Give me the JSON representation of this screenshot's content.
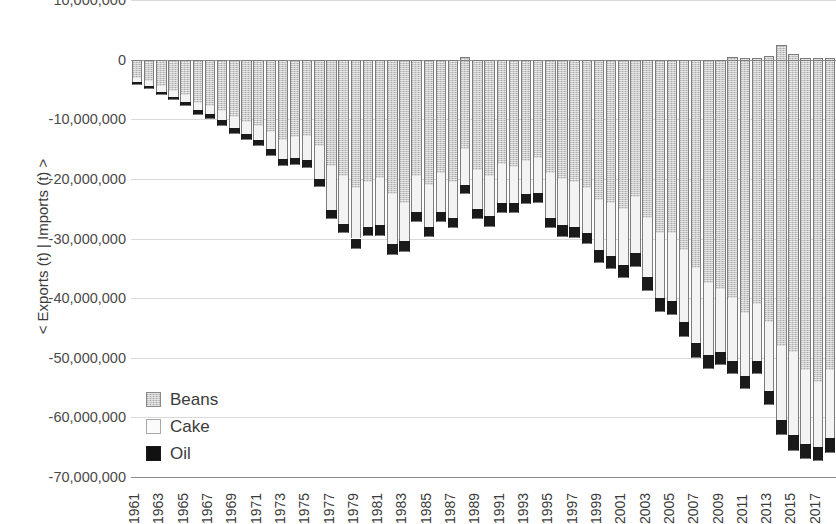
{
  "chart_data": {
    "type": "bar",
    "stacked": true,
    "orientation": "vertical",
    "title": "",
    "xlabel": "",
    "ylabel": "< Exports (t) | Imports (t) >",
    "ylim": [
      -70000000,
      10000000
    ],
    "ytick_labels": [
      "10,000,000",
      "0",
      "-10,000,000",
      "-20,000,000",
      "-30,000,000",
      "-40,000,000",
      "-50,000,000",
      "-60,000,000",
      "-70,000,000"
    ],
    "ytick_values": [
      10000000,
      0,
      -10000000,
      -20000000,
      -30000000,
      -40000000,
      -50000000,
      -60000000,
      -70000000
    ],
    "grid": true,
    "legend_position": "inside-lower-left",
    "legend": [
      "Beans",
      "Cake",
      "Oil"
    ],
    "colors": {
      "Beans": "#c9c9c9",
      "Cake": "#f3f3f3",
      "Oil": "#1a1a1a"
    },
    "categories": [
      1961,
      1962,
      1963,
      1964,
      1965,
      1966,
      1967,
      1968,
      1969,
      1970,
      1971,
      1972,
      1973,
      1974,
      1975,
      1976,
      1977,
      1978,
      1979,
      1980,
      1981,
      1982,
      1983,
      1984,
      1985,
      1986,
      1987,
      1988,
      1989,
      1990,
      1991,
      1992,
      1993,
      1994,
      1995,
      1996,
      1997,
      1998,
      1999,
      2000,
      2001,
      2002,
      2003,
      2004,
      2005,
      2006,
      2007,
      2008,
      2009,
      2010,
      2011,
      2012,
      2013,
      2014,
      2015,
      2016,
      2017,
      2018
    ],
    "xtick_labels": [
      "1961",
      "1963",
      "1965",
      "1967",
      "1969",
      "1971",
      "1973",
      "1975",
      "1977",
      "1979",
      "1981",
      "1983",
      "1985",
      "1987",
      "1989",
      "1991",
      "1993",
      "1995",
      "1997",
      "1999",
      "2001",
      "2003",
      "2005",
      "2007",
      "2009",
      "2011",
      "2013",
      "2015",
      "2017"
    ],
    "series": [
      {
        "name": "Beans",
        "values": [
          -3000000,
          -3600000,
          -4500000,
          -5200000,
          -6000000,
          -7200000,
          -7800000,
          -8600000,
          -9700000,
          -10500000,
          -11200000,
          -12200000,
          -13500000,
          -13000000,
          -12800000,
          -14500000,
          -17800000,
          -19500000,
          -21500000,
          -20500000,
          -19800000,
          -22500000,
          -24000000,
          -19500000,
          -21000000,
          -19000000,
          -20500000,
          -15000000,
          -18500000,
          -19500000,
          -17500000,
          -18000000,
          -17000000,
          -16500000,
          -19000000,
          -20000000,
          -20500000,
          -21500000,
          -23500000,
          -24000000,
          -25000000,
          -23000000,
          -26500000,
          -29000000,
          -29000000,
          -32000000,
          -35000000,
          -37500000,
          -38500000,
          -40000000,
          -42500000,
          -41000000,
          -44000000,
          -48000000,
          -49000000,
          -52000000,
          -54000000,
          -52000000
        ]
      },
      {
        "name": "Cake",
        "values": [
          -700000,
          -800000,
          -900000,
          -1000000,
          -1100000,
          -1300000,
          -1400000,
          -1600000,
          -1800000,
          -2000000,
          -2300000,
          -2800000,
          -3200000,
          -3500000,
          -4000000,
          -5500000,
          -7500000,
          -8000000,
          -8500000,
          -7500000,
          -8000000,
          -8500000,
          -6500000,
          -6000000,
          -7000000,
          -6500000,
          -6000000,
          -6000000,
          -6500000,
          -6800000,
          -6500000,
          -6000000,
          -5500000,
          -5800000,
          -7500000,
          -7800000,
          -7500000,
          -7500000,
          -8500000,
          -9000000,
          -9500000,
          -9500000,
          -10000000,
          -11000000,
          -11500000,
          -12000000,
          -12500000,
          -12000000,
          -10500000,
          -10500000,
          -10500000,
          -9500000,
          -11500000,
          -12500000,
          -14000000,
          -12500000,
          -11000000,
          -11500000
        ]
      },
      {
        "name": "Oil",
        "values": [
          -500000,
          -550000,
          -600000,
          -650000,
          -700000,
          -750000,
          -800000,
          -850000,
          -900000,
          -950000,
          -1000000,
          -1100000,
          -1200000,
          -1200000,
          -1300000,
          -1400000,
          -1500000,
          -1600000,
          -1700000,
          -1600000,
          -1700000,
          -1800000,
          -1800000,
          -1700000,
          -1800000,
          -1700000,
          -1700000,
          -1600000,
          -1700000,
          -1800000,
          -1700000,
          -1700000,
          -1700000,
          -1700000,
          -1800000,
          -1900000,
          -1900000,
          -2000000,
          -2100000,
          -2200000,
          -2200000,
          -2200000,
          -2300000,
          -2400000,
          -2400000,
          -2500000,
          -2500000,
          -2400000,
          -2300000,
          -2300000,
          -2300000,
          -2200000,
          -2400000,
          -2500000,
          -2700000,
          -2500000,
          -2400000,
          -2400000
        ]
      }
    ],
    "positive_beans": [
      0,
      0,
      0,
      0,
      0,
      0,
      0,
      0,
      0,
      0,
      0,
      0,
      0,
      0,
      0,
      0,
      0,
      0,
      0,
      0,
      0,
      0,
      0,
      0,
      0,
      0,
      0,
      400000,
      0,
      0,
      0,
      0,
      0,
      0,
      0,
      0,
      0,
      0,
      0,
      0,
      0,
      0,
      0,
      0,
      0,
      0,
      0,
      0,
      0,
      500000,
      300000,
      200000,
      600000,
      2400000,
      900000,
      300000,
      200000,
      300000
    ]
  }
}
